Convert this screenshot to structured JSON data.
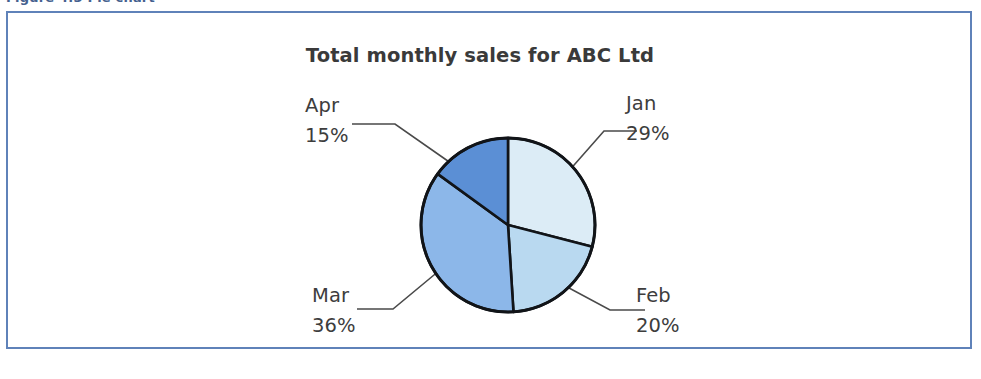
{
  "caption": {
    "text": "Figure 4.3  Pie chart"
  },
  "figure": {
    "border_color": "#5f82b9",
    "background": "#ffffff"
  },
  "chart_data": {
    "type": "pie",
    "title": "Total monthly sales for ABC Ltd",
    "xlabel": "",
    "ylabel": "",
    "categories": [
      "Jan",
      "Feb",
      "Mar",
      "Apr"
    ],
    "values": [
      29,
      20,
      36,
      15
    ],
    "value_unit": "%",
    "legend": "none",
    "grid": false,
    "start_angle_deg": 0,
    "direction": "clockwise",
    "slices": [
      {
        "label": "Jan",
        "value": 29,
        "value_text": "29%",
        "color": "#dcecf6",
        "label_x": 626,
        "label_y": 110,
        "pct_x": 626,
        "pct_y": 140,
        "leader": "M 560,181 L 604,131 L 637,131"
      },
      {
        "label": "Feb",
        "value": 20,
        "value_text": "20%",
        "color": "#b9d9f0",
        "label_x": 636,
        "label_y": 302,
        "pct_x": 636,
        "pct_y": 332,
        "leader": "M 556,281 L 610,310 L 645,310"
      },
      {
        "label": "Mar",
        "value": 36,
        "value_text": "36%",
        "color": "#8cb7e9",
        "label_x": 312,
        "label_y": 302,
        "pct_x": 312,
        "pct_y": 332,
        "leader": "M 440,270 L 393,309 L 357,309"
      },
      {
        "label": "Apr",
        "value": 15,
        "value_text": "15%",
        "color": "#5b8fd5",
        "label_x": 305,
        "label_y": 112,
        "pct_x": 305,
        "pct_y": 142,
        "leader": "M 455,166 L 395,124 L 352,124"
      }
    ],
    "geometry": {
      "center_x": 508,
      "center_y": 225,
      "radius": 87,
      "title_x": 480,
      "title_y": 62
    },
    "outline_color": "#111418"
  }
}
